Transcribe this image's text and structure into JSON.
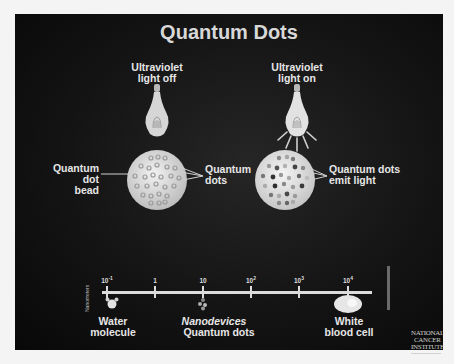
{
  "title": "Quantum Dots",
  "left_panel": {
    "heading_line1": "Ultraviolet",
    "heading_line2": "light off",
    "bead_label_line1": "Quantum dot",
    "bead_label_line2": "bead",
    "dots_label_line1": "Quantum",
    "dots_label_line2": "dots"
  },
  "right_panel": {
    "heading_line1": "Ultraviolet",
    "heading_line2": "light on",
    "emit_label_line1": "Quantum dots",
    "emit_label_line2": "emit light"
  },
  "scale": {
    "axis_label": "Nanometers",
    "ticks": [
      {
        "base": "10",
        "exp": "-1"
      },
      {
        "base": "1",
        "exp": ""
      },
      {
        "base": "10",
        "exp": ""
      },
      {
        "base": "10",
        "exp": "2"
      },
      {
        "base": "10",
        "exp": "3"
      },
      {
        "base": "10",
        "exp": "4"
      }
    ],
    "items": {
      "water_line1": "Water",
      "water_line2": "molecule",
      "nano_line1": "Nanodevices",
      "nano_line2": "Quantum dots",
      "wbc_line1": "White",
      "wbc_line2": "blood cell"
    }
  },
  "logo": {
    "line1": "NATIONAL",
    "line2": "CANCER",
    "line3": "INSTITUTE"
  },
  "colors": {
    "background": "#0e0e0e",
    "text": "#e6e6e6",
    "bead_fill": "#d9d9d9"
  }
}
